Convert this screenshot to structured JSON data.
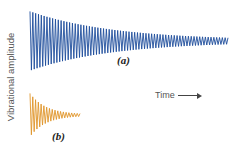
{
  "ylabel": "Vibrational amplitude",
  "xlabel": "Time",
  "labels": {
    "a": "(a)",
    "b": "(b)"
  },
  "colors": {
    "a": "#1f4e9c",
    "b": "#e0952a"
  },
  "chart_data": {
    "type": "line",
    "title": "",
    "xlabel": "Time",
    "ylabel": "Vibrational amplitude",
    "grid": false,
    "series": [
      {
        "name": "(a)",
        "color": "#1f4e9c",
        "description": "slowly decaying oscillation",
        "x_start": 30,
        "x_end": 228,
        "center_y": 41,
        "initial_amplitude": 29,
        "cycles": 70,
        "decay": 2.4
      },
      {
        "name": "(b)",
        "color": "#e0952a",
        "description": "rapidly decaying oscillation",
        "x_start": 30,
        "x_end": 80,
        "center_y": 115,
        "initial_amplitude": 21,
        "cycles": 18,
        "decay": 3.2
      }
    ]
  }
}
